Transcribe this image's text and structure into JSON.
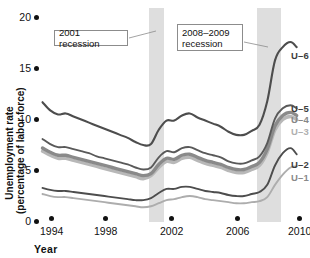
{
  "chart_data": {
    "type": "line",
    "title": "",
    "xlabel": "Year",
    "ylabel": "Unemployment rate (percentage of labor force)",
    "ylabel_line1": "Unemployment rate",
    "ylabel_line2": "(percentage of labor force)",
    "xlim": [
      1994,
      2010.6
    ],
    "ylim": [
      0,
      20
    ],
    "yticks": [
      0,
      5,
      10,
      15,
      20
    ],
    "ytick_labels": [
      "0",
      "5",
      "10",
      "15",
      "20"
    ],
    "xticks": [
      1994,
      1998,
      2002,
      2006,
      2010
    ],
    "xtick_labels": [
      "1994",
      "1998",
      "2002",
      "2006",
      "2010"
    ],
    "grid": false,
    "legend_position": "right-of-line-ends",
    "annotations": [
      {
        "name": "recession-2001-callout",
        "lines": [
          "2001 recession"
        ],
        "text": "2001 recession",
        "points_to_year": 2001.1
      },
      {
        "name": "recession-2008-2009-callout",
        "lines": [
          "2008–2009",
          "recession"
        ],
        "text": "2008–2009 recession",
        "points_to_year": 2008.7
      }
    ],
    "shaded_bands": [
      {
        "name": "2001 recession",
        "start": 2001.2,
        "end": 2001.9,
        "color": "#dedede"
      },
      {
        "name": "2008–2009 recession",
        "start": 2007.95,
        "end": 2009.5,
        "color": "#dedede"
      }
    ],
    "x": [
      1994.0,
      1994.5,
      1995.0,
      1995.5,
      1996.0,
      1996.5,
      1997.0,
      1997.5,
      1998.0,
      1998.5,
      1999.0,
      1999.5,
      2000.0,
      2000.5,
      2001.0,
      2001.5,
      2002.0,
      2002.5,
      2003.0,
      2003.5,
      2004.0,
      2004.5,
      2005.0,
      2005.5,
      2006.0,
      2006.5,
      2007.0,
      2007.5,
      2008.0,
      2008.5,
      2009.0,
      2009.5,
      2010.0,
      2010.4
    ],
    "series": [
      {
        "name": "U-6",
        "label": "U–6",
        "color": "#4d4d4d",
        "width": 2.1,
        "values": [
          11.4,
          10.6,
          10.2,
          10.3,
          10.0,
          9.7,
          9.4,
          9.1,
          8.8,
          8.5,
          8.2,
          7.9,
          7.5,
          7.2,
          7.3,
          8.7,
          9.6,
          9.6,
          10.1,
          10.3,
          9.9,
          9.6,
          9.3,
          9.0,
          8.5,
          8.2,
          8.2,
          8.6,
          9.2,
          11.5,
          15.5,
          16.8,
          17.3,
          16.8
        ]
      },
      {
        "name": "U-5",
        "label": "U–5",
        "color": "#595959",
        "width": 1.9,
        "values": [
          7.8,
          7.3,
          7.0,
          7.0,
          6.8,
          6.6,
          6.4,
          6.1,
          5.9,
          5.7,
          5.5,
          5.3,
          5.0,
          4.8,
          5.0,
          6.0,
          6.6,
          6.5,
          6.9,
          7.0,
          6.7,
          6.4,
          6.2,
          6.0,
          5.6,
          5.4,
          5.4,
          5.7,
          6.1,
          7.4,
          9.8,
          10.8,
          11.1,
          10.8
        ]
      },
      {
        "name": "U-4",
        "label": "U–4",
        "color": "#8a8a8a",
        "width": 3.4,
        "values": [
          6.9,
          6.5,
          6.2,
          6.2,
          6.0,
          5.8,
          5.6,
          5.4,
          5.2,
          5.0,
          4.8,
          4.6,
          4.4,
          4.2,
          4.4,
          5.3,
          5.9,
          5.8,
          6.2,
          6.3,
          6.0,
          5.7,
          5.5,
          5.3,
          5.0,
          4.8,
          4.8,
          5.1,
          5.5,
          6.8,
          9.1,
          10.1,
          10.4,
          10.1
        ]
      },
      {
        "name": "U-3",
        "label": "U–3",
        "color": "#b8b8b8",
        "width": 3.4,
        "values": [
          6.6,
          6.2,
          5.9,
          5.9,
          5.7,
          5.5,
          5.3,
          5.1,
          4.9,
          4.7,
          4.5,
          4.3,
          4.1,
          3.9,
          4.2,
          5.0,
          5.6,
          5.5,
          5.9,
          6.0,
          5.7,
          5.4,
          5.2,
          5.0,
          4.7,
          4.5,
          4.5,
          4.8,
          5.2,
          6.5,
          8.7,
          9.7,
          10.0,
          9.7
        ]
      },
      {
        "name": "U-2",
        "label": "U–2",
        "color": "#4d4d4d",
        "width": 1.9,
        "values": [
          3.0,
          2.8,
          2.7,
          2.7,
          2.6,
          2.5,
          2.4,
          2.3,
          2.2,
          2.1,
          2.0,
          1.9,
          1.8,
          1.8,
          2.0,
          2.5,
          2.9,
          2.9,
          3.1,
          3.1,
          2.9,
          2.7,
          2.6,
          2.5,
          2.3,
          2.2,
          2.2,
          2.4,
          2.6,
          3.3,
          5.2,
          6.4,
          6.9,
          6.3
        ]
      },
      {
        "name": "U-1",
        "label": "U–1",
        "color": "#adadad",
        "width": 1.9,
        "values": [
          2.4,
          2.2,
          2.1,
          2.1,
          2.0,
          1.9,
          1.8,
          1.7,
          1.6,
          1.5,
          1.4,
          1.3,
          1.2,
          1.1,
          1.2,
          1.5,
          1.8,
          1.9,
          2.1,
          2.2,
          2.1,
          1.9,
          1.8,
          1.7,
          1.6,
          1.5,
          1.5,
          1.6,
          1.7,
          2.1,
          3.3,
          4.3,
          5.0,
          5.1
        ]
      }
    ]
  }
}
